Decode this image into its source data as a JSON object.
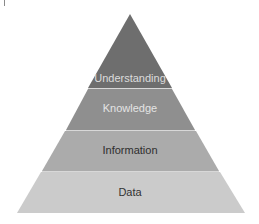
{
  "diagram": {
    "type": "pyramid",
    "levels": [
      {
        "label": "Understanding",
        "fill": "#6e6e6e",
        "text_color": "#dcdcdc",
        "font_size": 11
      },
      {
        "label": "Knowledge",
        "fill": "#8f8f8f",
        "text_color": "#e4e4e4",
        "font_size": 11
      },
      {
        "label": "Information",
        "fill": "#ababab",
        "text_color": "#2e2e2e",
        "font_size": 11
      },
      {
        "label": "Data",
        "fill": "#cbcbcb",
        "text_color": "#333333",
        "font_size": 11
      }
    ],
    "separator_color": "#d8d8d8",
    "background": "#ffffff"
  }
}
